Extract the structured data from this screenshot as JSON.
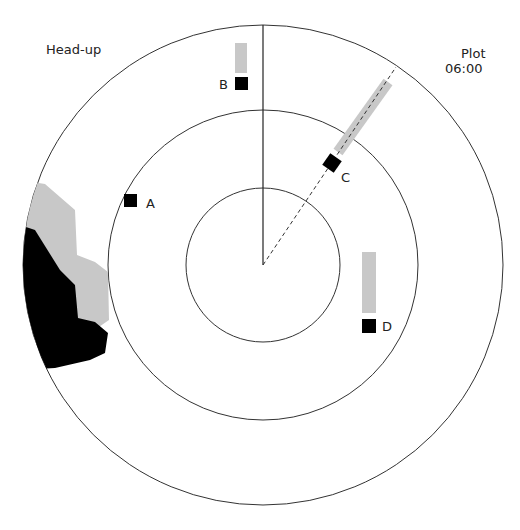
{
  "display": {
    "orientation_label": "Head-up",
    "mode_label": "Plot",
    "time_label": "06:00"
  },
  "radar": {
    "center": [
      263,
      265
    ],
    "rings": [
      77,
      155,
      240
    ],
    "heading_line_color": "#222222",
    "echo_color": "#000000",
    "trail_color": "#c8c8c8"
  },
  "targets": [
    {
      "id": "A",
      "label": "A",
      "x": 130,
      "y": 200
    },
    {
      "id": "B",
      "label": "B",
      "x": 241,
      "y": 84
    },
    {
      "id": "C",
      "label": "C",
      "x": 332,
      "y": 163
    },
    {
      "id": "D",
      "label": "D",
      "x": 369,
      "y": 326
    }
  ]
}
